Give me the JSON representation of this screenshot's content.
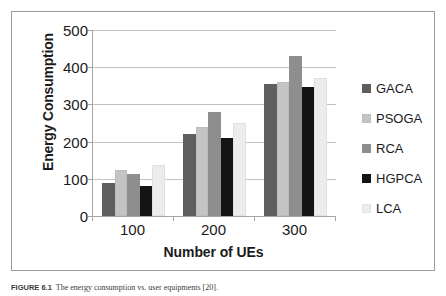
{
  "figure": {
    "caption_label": "FIGURE 6.1",
    "caption_text": "The energy consumption vs. user equipments [20]."
  },
  "chart_data": {
    "type": "bar",
    "title": "",
    "xlabel": "Number of UEs",
    "ylabel": "Energy Consumption",
    "categories": [
      "100",
      "200",
      "300"
    ],
    "ylim": [
      0,
      500
    ],
    "yticks": [
      0,
      100,
      200,
      300,
      400,
      500
    ],
    "ytick_labels": [
      "0",
      "100",
      "200",
      "300",
      "400",
      "500"
    ],
    "grid": true,
    "legend_position": "right",
    "series": [
      {
        "name": "GACA",
        "color": "#5e5e5e",
        "values": [
          90,
          220,
          355
        ]
      },
      {
        "name": "PSOGA",
        "color": "#c4c4c4",
        "values": [
          123,
          240,
          360
        ]
      },
      {
        "name": "RCA",
        "color": "#8e8e8e",
        "values": [
          112,
          280,
          430
        ]
      },
      {
        "name": "HGPCA",
        "color": "#141414",
        "values": [
          81,
          210,
          348
        ]
      },
      {
        "name": "LCA",
        "color": "#ececec",
        "values": [
          138,
          250,
          372
        ]
      }
    ]
  },
  "legend": {
    "items": [
      {
        "label": "GACA",
        "color": "#5e5e5e"
      },
      {
        "label": "PSOGA",
        "color": "#c4c4c4"
      },
      {
        "label": "RCA",
        "color": "#8e8e8e"
      },
      {
        "label": "HGPCA",
        "color": "#141414"
      },
      {
        "label": "LCA",
        "color": "#ececec"
      }
    ]
  }
}
